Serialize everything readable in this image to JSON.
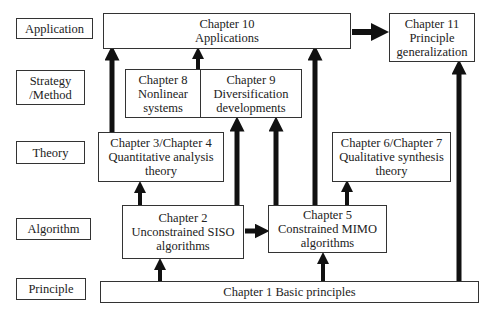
{
  "levels": {
    "application": "Application",
    "strategy": [
      "Strategy",
      "/Method"
    ],
    "theory": "Theory",
    "algorithm": "Algorithm",
    "principle": "Principle"
  },
  "chapters": {
    "ch10": [
      "Chapter 10",
      "Applications"
    ],
    "ch11": [
      "Chapter 11",
      "Principle",
      "generalization"
    ],
    "ch8": [
      "Chapter 8",
      "Nonlinear",
      "systems"
    ],
    "ch9": [
      "Chapter 9",
      "Diversification",
      "developments"
    ],
    "ch34": [
      "Chapter 3/Chapter 4",
      "Quantitative analysis",
      "theory"
    ],
    "ch67": [
      "Chapter 6/Chapter 7",
      "Qualitative synthesis",
      "theory"
    ],
    "ch2": [
      "Chapter 2",
      "Unconstrained SISO",
      "algorithms"
    ],
    "ch5": [
      "Chapter 5",
      "Constrained MIMO",
      "algorithms"
    ],
    "ch1": "Chapter 1 Basic principles"
  },
  "colors": {
    "border": "#333333",
    "arrow": "#111111",
    "background": "#ffffff"
  }
}
